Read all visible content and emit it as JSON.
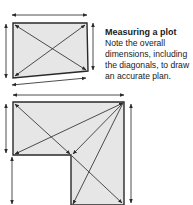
{
  "caption": {
    "title": "Measuring a plot",
    "body": "Note the overall dimensions, including the diagonals, to draw an accurate plan."
  },
  "colors": {
    "fill": "#e6e6e6",
    "stroke": "#2a2a2a",
    "arrow": "#3a3a3a"
  },
  "diagrams": [
    {
      "name": "rectangular-plot",
      "shape": "quadrilateral",
      "vertices": [
        [
          13,
          23
        ],
        [
          87,
          23
        ],
        [
          88,
          71
        ],
        [
          13,
          78
        ]
      ],
      "dimension_arrows": [
        "top",
        "left",
        "right",
        "bottom"
      ],
      "diagonals": 2
    },
    {
      "name": "l-shaped-plot",
      "shape": "L",
      "vertices": [
        [
          13,
          102
        ],
        [
          124,
          102
        ],
        [
          124,
          205
        ],
        [
          71,
          205
        ],
        [
          71,
          155
        ],
        [
          13,
          155
        ]
      ],
      "dimension_arrows": [
        "top",
        "left-upper",
        "left-lower",
        "right"
      ],
      "diagonals": 4
    }
  ]
}
